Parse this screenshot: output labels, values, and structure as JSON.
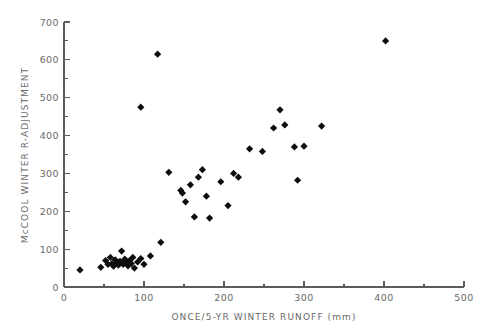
{
  "chart_data": {
    "type": "scatter",
    "title": "",
    "xlabel": "ONCE/5-YR WINTER RUNOFF  (mm)",
    "ylabel": "McCOOL WINTER R-ADJUSTMENT",
    "xlim": [
      0,
      500
    ],
    "ylim": [
      0,
      700
    ],
    "xticks": [
      0,
      100,
      200,
      300,
      400,
      500
    ],
    "yticks": [
      0,
      100,
      200,
      300,
      400,
      500,
      600,
      700
    ],
    "xtick_labels": [
      "0",
      "100",
      "200",
      "300",
      "400",
      "500"
    ],
    "ytick_labels": [
      "0",
      "100",
      "200",
      "300",
      "400",
      "500",
      "600",
      "700"
    ],
    "x_minor_interval": 50,
    "y_minor_interval": 50,
    "grid": false,
    "legend": null,
    "marker": "diamond",
    "marker_color": "#0d0d0d",
    "marker_size": 6,
    "points": [
      [
        20,
        45
      ],
      [
        46,
        52
      ],
      [
        52,
        70
      ],
      [
        55,
        60
      ],
      [
        58,
        78
      ],
      [
        60,
        62
      ],
      [
        62,
        55
      ],
      [
        64,
        72
      ],
      [
        66,
        64
      ],
      [
        68,
        58
      ],
      [
        70,
        68
      ],
      [
        72,
        95
      ],
      [
        74,
        60
      ],
      [
        76,
        74
      ],
      [
        78,
        66
      ],
      [
        80,
        56
      ],
      [
        82,
        70
      ],
      [
        84,
        62
      ],
      [
        86,
        78
      ],
      [
        88,
        50
      ],
      [
        92,
        66
      ],
      [
        96,
        75
      ],
      [
        100,
        60
      ],
      [
        108,
        82
      ],
      [
        96,
        475
      ],
      [
        117,
        615
      ],
      [
        121,
        118
      ],
      [
        131,
        303
      ],
      [
        146,
        255
      ],
      [
        148,
        248
      ],
      [
        152,
        225
      ],
      [
        158,
        270
      ],
      [
        163,
        185
      ],
      [
        168,
        290
      ],
      [
        173,
        310
      ],
      [
        178,
        240
      ],
      [
        182,
        182
      ],
      [
        196,
        278
      ],
      [
        205,
        215
      ],
      [
        212,
        300
      ],
      [
        218,
        290
      ],
      [
        232,
        365
      ],
      [
        248,
        358
      ],
      [
        262,
        420
      ],
      [
        270,
        468
      ],
      [
        276,
        428
      ],
      [
        288,
        370
      ],
      [
        292,
        282
      ],
      [
        300,
        372
      ],
      [
        322,
        425
      ],
      [
        402,
        650
      ]
    ]
  },
  "axes": {
    "x_axis_name": "x-axis",
    "y_axis_name": "y-axis"
  }
}
